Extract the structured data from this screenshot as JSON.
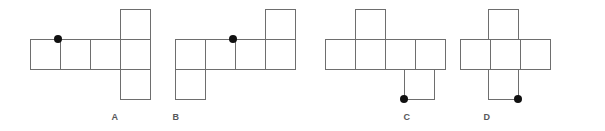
{
  "figure": {
    "type": "cube-net-multiple-choice",
    "cell_size": 30,
    "stroke_color": "#6e6e6e",
    "dot_color": "#111111",
    "label_color": "#58585a",
    "background_color": "#ffffff",
    "options": [
      {
        "label": "A",
        "label_x": 115,
        "label_y": 112,
        "squares": [
          {
            "x": 30,
            "y": 39
          },
          {
            "x": 60,
            "y": 39
          },
          {
            "x": 90,
            "y": 39
          },
          {
            "x": 120,
            "y": 39
          },
          {
            "x": 120,
            "y": 9
          },
          {
            "x": 120,
            "y": 69
          }
        ],
        "dot": {
          "x": 58,
          "y": 39,
          "r": 4
        }
      },
      {
        "label": "B",
        "label_x": 176,
        "label_y": 112,
        "squares": [
          {
            "x": 175,
            "y": 39
          },
          {
            "x": 205,
            "y": 39
          },
          {
            "x": 235,
            "y": 39
          },
          {
            "x": 265,
            "y": 39
          },
          {
            "x": 175,
            "y": 69
          },
          {
            "x": 265,
            "y": 9
          }
        ],
        "dot": {
          "x": 233,
          "y": 39,
          "r": 4
        }
      },
      {
        "label": "C",
        "label_x": 407,
        "label_y": 112,
        "squares": [
          {
            "x": 325,
            "y": 39
          },
          {
            "x": 355,
            "y": 39
          },
          {
            "x": 385,
            "y": 39
          },
          {
            "x": 415,
            "y": 39
          },
          {
            "x": 355,
            "y": 9
          },
          {
            "x": 404,
            "y": 69
          }
        ],
        "dot": {
          "x": 404,
          "y": 99,
          "r": 4
        }
      },
      {
        "label": "D",
        "label_x": 487,
        "label_y": 112,
        "squares": [
          {
            "x": 460,
            "y": 39
          },
          {
            "x": 490,
            "y": 39
          },
          {
            "x": 520,
            "y": 39
          },
          {
            "x": 488,
            "y": 9
          },
          {
            "x": 488,
            "y": 69
          }
        ],
        "dot": {
          "x": 518,
          "y": 99,
          "r": 4
        }
      }
    ]
  }
}
